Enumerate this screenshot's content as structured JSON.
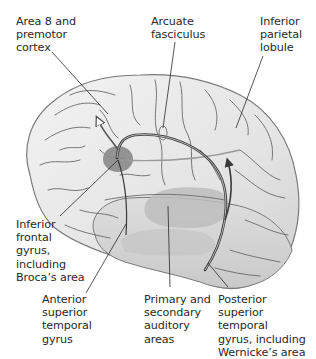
{
  "diagram": {
    "type": "anatomical-illustration",
    "colors": {
      "background": "#ffffff",
      "brain_fill": "#e9e9e9",
      "brain_outline": "#7a7a7a",
      "sulci": "#6e6e6e",
      "broca_area": "#8a8a8a",
      "wernicke_region": "#b9b9b9",
      "arcuate_pathway": "#3a3a3a",
      "leader_lines": "#2a2a2a",
      "label_text": "#2a2a2a"
    },
    "labels": {
      "area8": "Area 8 and\npremotor\ncortex",
      "arcuate": "Arcuate\nfasciculus",
      "parietal": "Inferior\nparietal\nlobule",
      "inferior_frontal": "Inferior\nfrontal\ngyrus,\nincluding\nBroca’s area",
      "anterior_temporal": "Anterior\nsuperior\ntemporal\ngyrus",
      "auditory": "Primary and\nsecondary\nauditory\nareas",
      "posterior_temporal": "Posterior\nsuperior temporal\ngyrus, including\nWernicke’s area"
    }
  }
}
